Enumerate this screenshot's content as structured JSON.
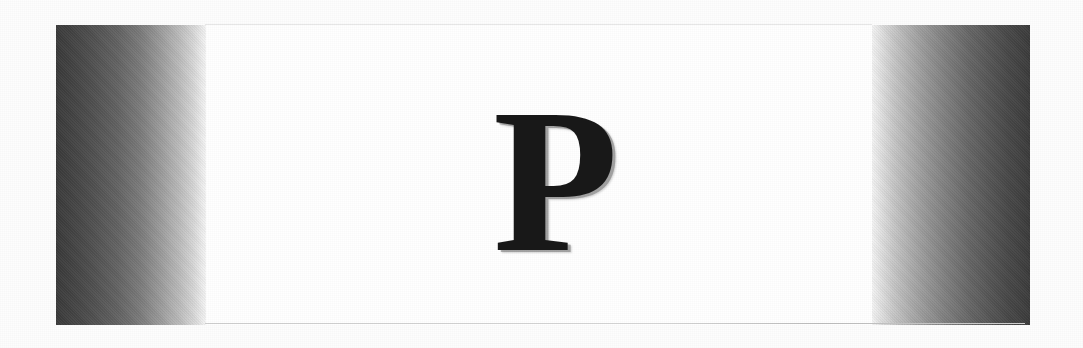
{
  "document": {
    "type": "scanned-page",
    "page_background": "#ffffff",
    "scan_background": "#fdfdfd",
    "dropcap": {
      "character": "P",
      "role": "drop-cap-initial",
      "color": "#181818",
      "shadow_color": "#969696",
      "typeface_style": "serif-bold"
    },
    "gutter_left": {
      "name": "scanner-shadow-left",
      "dark_color": "#3b3b3b",
      "light_color": "#f7f7f7",
      "direction": "dark-to-light"
    },
    "gutter_right": {
      "name": "scanner-shadow-right",
      "dark_color": "#3c3c3c",
      "light_color": "#f5f5f5",
      "direction": "light-to-dark"
    },
    "rules": {
      "top_rule_color": "#e7e7e7",
      "bottom_rule_color": "#cfcfcf"
    }
  }
}
